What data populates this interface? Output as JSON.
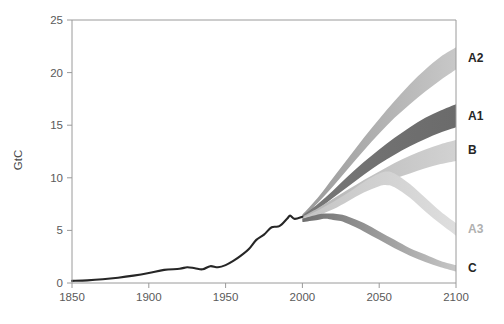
{
  "figure": {
    "background_color": "#ffffff",
    "plot_frame_color": "#9a9a9a"
  },
  "axes": {
    "y_axis_title": "GtC",
    "y_ticks": [
      "0",
      "5",
      "10",
      "15",
      "20",
      "25"
    ],
    "x_ticks": [
      "1850",
      "1900",
      "1950",
      "2000",
      "2050",
      "2100"
    ]
  },
  "chart_data": {
    "type": "area",
    "title": "",
    "xlabel": "",
    "ylabel": "GtC",
    "xlim": [
      1850,
      2100
    ],
    "ylim": [
      0,
      25
    ],
    "grid": false,
    "legend_position": "right-outside",
    "x_ticks": [
      1850,
      1900,
      1950,
      2000,
      2050,
      2100
    ],
    "y_ticks": [
      0,
      5,
      10,
      15,
      20,
      25
    ],
    "historical": {
      "name": "Historical emissions",
      "color": "#262626",
      "x": [
        1850,
        1860,
        1870,
        1880,
        1890,
        1900,
        1910,
        1920,
        1925,
        1930,
        1935,
        1940,
        1945,
        1950,
        1955,
        1960,
        1965,
        1970,
        1975,
        1980,
        1985,
        1990,
        1992,
        1995,
        2000
      ],
      "y": [
        0.2,
        0.25,
        0.35,
        0.5,
        0.7,
        0.95,
        1.25,
        1.35,
        1.5,
        1.4,
        1.3,
        1.6,
        1.5,
        1.7,
        2.1,
        2.6,
        3.2,
        4.1,
        4.6,
        5.3,
        5.4,
        6.1,
        6.4,
        6.1,
        6.3
      ]
    },
    "series": [
      {
        "name": "A2",
        "label": "A2",
        "label_color": "#262626",
        "band_color_start": "#9a9a9a",
        "band_color_end": "#c8c8c8",
        "x": [
          2000,
          2010,
          2020,
          2030,
          2040,
          2050,
          2060,
          2070,
          2080,
          2090,
          2100
        ],
        "y_low": [
          6.2,
          7.6,
          9.2,
          10.9,
          12.6,
          14.2,
          15.7,
          17.0,
          18.2,
          19.3,
          20.3
        ],
        "y_high": [
          6.5,
          8.1,
          10.0,
          11.9,
          13.8,
          15.6,
          17.3,
          18.9,
          20.3,
          21.5,
          22.4
        ]
      },
      {
        "name": "A1",
        "label": "A1",
        "label_color": "#262626",
        "band_color_start": "#777777",
        "band_color_end": "#6b6b6b",
        "x": [
          2000,
          2010,
          2020,
          2030,
          2040,
          2050,
          2060,
          2070,
          2080,
          2090,
          2100
        ],
        "y_low": [
          6.1,
          7.0,
          8.1,
          9.2,
          10.3,
          11.3,
          12.2,
          13.0,
          13.7,
          14.3,
          14.8
        ],
        "y_high": [
          6.4,
          7.5,
          8.8,
          10.2,
          11.5,
          12.7,
          13.8,
          14.8,
          15.7,
          16.4,
          17.0
        ]
      },
      {
        "name": "B",
        "label": "B",
        "label_color": "#262626",
        "band_color_start": "#b4b4b4",
        "band_color_end": "#d2d2d2",
        "x": [
          2000,
          2010,
          2020,
          2030,
          2040,
          2050,
          2060,
          2070,
          2080,
          2090,
          2100
        ],
        "y_low": [
          6.0,
          6.6,
          7.3,
          8.0,
          8.7,
          9.3,
          9.9,
          10.4,
          10.9,
          11.3,
          11.6
        ],
        "y_high": [
          6.3,
          7.1,
          8.0,
          8.9,
          9.8,
          10.6,
          11.4,
          12.1,
          12.7,
          13.2,
          13.6
        ]
      },
      {
        "name": "A3",
        "label": "A3",
        "label_color": "#b0b0b0",
        "band_color_start": "#c4c4c4",
        "band_color_end": "#dedede",
        "x": [
          2000,
          2010,
          2020,
          2030,
          2040,
          2050,
          2055,
          2060,
          2070,
          2080,
          2090,
          2100
        ],
        "y_low": [
          5.9,
          6.4,
          7.0,
          7.8,
          8.6,
          9.2,
          9.3,
          9.1,
          8.1,
          6.8,
          5.6,
          4.5
        ],
        "y_high": [
          6.2,
          6.9,
          7.7,
          8.6,
          9.6,
          10.4,
          10.6,
          10.4,
          9.4,
          8.1,
          6.8,
          5.7
        ]
      },
      {
        "name": "C",
        "label": "C",
        "label_color": "#262626",
        "band_color_start": "#6f6f6f",
        "band_color_end": "#c6c6c6",
        "x": [
          2000,
          2010,
          2015,
          2020,
          2025,
          2030,
          2040,
          2050,
          2060,
          2070,
          2080,
          2090,
          2100
        ],
        "y_low": [
          5.8,
          6.0,
          6.1,
          6.0,
          5.9,
          5.6,
          4.9,
          4.1,
          3.3,
          2.6,
          2.0,
          1.5,
          1.1
        ],
        "y_high": [
          6.1,
          6.5,
          6.6,
          6.6,
          6.5,
          6.3,
          5.7,
          4.9,
          4.1,
          3.3,
          2.7,
          2.1,
          1.7
        ]
      }
    ]
  }
}
